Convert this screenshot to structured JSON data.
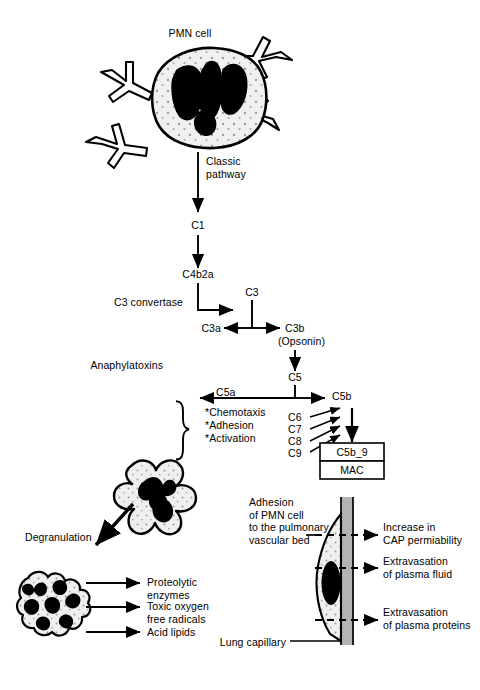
{
  "figure": {
    "background_color": "#ffffff",
    "ink_color": "#000000",
    "cell_fill_color": "#f0f0f0",
    "vessel_wall_color": "#b3b3b3"
  },
  "top_cell": {
    "title": "PMN cell",
    "antibody_count": 4,
    "icon": "pmn-cell-with-antibodies"
  },
  "cascade": {
    "classic_pathway_label": "Classic\npathway",
    "c1": "C1",
    "c4b2a": "C4b2a",
    "c3_convertase_label": "C3 convertase",
    "c3": "C3",
    "c3a": "C3a",
    "c3b": "C3b",
    "c3b_note": "(Opsonin)",
    "anaphylatoxins_label": "Anaphylatoxins",
    "c5": "C5",
    "c5a": "C5a",
    "c5b": "C5b",
    "c5a_effects": [
      "*Chemotaxis",
      "*Adhesion",
      "*Activation"
    ],
    "terminal_components": [
      "C6",
      "C7",
      "C8",
      "C9"
    ],
    "mac_box": {
      "top_label": "C5b_9",
      "bottom_label": "MAC"
    }
  },
  "degranulation": {
    "label": "Degranulation",
    "activated_cell_icon": "activated-pmn-cell",
    "granule_cluster_icon": "granule-cluster",
    "products": [
      "Proteolytic\nenzymes",
      "Toxic oxygen\nfree radicals",
      "Acid lipids"
    ]
  },
  "capillary": {
    "adhesion_label": "Adhesion\nof PMN cell\nto the pulmonary\nvascular bed",
    "lung_capillary_label": "Lung capillary",
    "effects": [
      "Increase in\nCAP permiability",
      "Extravasation\nof plasma fluid",
      "Extravasation\nof plasma proteins"
    ]
  }
}
